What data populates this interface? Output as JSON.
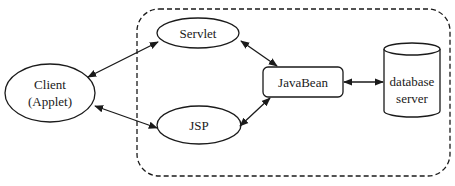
{
  "diagram": {
    "type": "architecture",
    "boundary": {
      "label": "",
      "style": "dashed-rounded"
    },
    "nodes": [
      {
        "id": "client",
        "shape": "ellipse",
        "lines": [
          "Client",
          "(Applet)"
        ]
      },
      {
        "id": "servlet",
        "shape": "ellipse",
        "lines": [
          "Servlet"
        ]
      },
      {
        "id": "jsp",
        "shape": "ellipse",
        "lines": [
          "JSP"
        ]
      },
      {
        "id": "javabean",
        "shape": "rounded-rect",
        "lines": [
          "JavaBean"
        ]
      },
      {
        "id": "database",
        "shape": "cylinder",
        "lines": [
          "database",
          "server"
        ]
      }
    ],
    "edges": [
      {
        "from": "client",
        "to": "servlet",
        "direction": "bidirectional"
      },
      {
        "from": "client",
        "to": "jsp",
        "direction": "bidirectional"
      },
      {
        "from": "servlet",
        "to": "javabean",
        "direction": "bidirectional"
      },
      {
        "from": "jsp",
        "to": "javabean",
        "direction": "bidirectional"
      },
      {
        "from": "javabean",
        "to": "database",
        "direction": "bidirectional"
      }
    ],
    "colors": {
      "stroke": "#1a1a1a",
      "background": "#ffffff"
    }
  },
  "labels": {
    "client_line1": "Client",
    "client_line2": "(Applet)",
    "servlet": "Servlet",
    "jsp": "JSP",
    "javabean": "JavaBean",
    "database_line1": "database",
    "database_line2": "server"
  }
}
